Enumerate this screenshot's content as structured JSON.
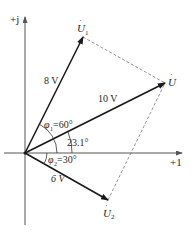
{
  "diagram": {
    "type": "phasor",
    "axes": {
      "real_label": "+1",
      "imag_label": "+j"
    },
    "phasors": [
      {
        "id": "U1",
        "label_main": "U",
        "label_sub": "1",
        "magnitude_label": "8 V",
        "angle_deg": 60
      },
      {
        "id": "U",
        "label_main": "U",
        "label_sub": "",
        "magnitude_label": "10 V",
        "angle_deg": 23.1
      },
      {
        "id": "U2",
        "label_main": "U",
        "label_sub": "2",
        "magnitude_label": "6 V",
        "angle_deg": -30
      }
    ],
    "angles": {
      "phi1": {
        "symbol": "φ",
        "sub": "1",
        "text": "=60°"
      },
      "result": {
        "text": "23.1°"
      },
      "phi2": {
        "symbol": "φ",
        "sub": "2",
        "text": "=30°"
      }
    },
    "colors": {
      "line": "#1a1a1a",
      "axis": "#555555",
      "dashed": "#777777",
      "text": "#2a2a2a"
    }
  }
}
